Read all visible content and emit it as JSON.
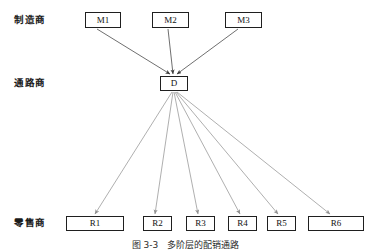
{
  "figure": {
    "width": 371,
    "height": 251,
    "background": "#ffffff",
    "caption": "图 3-3　多阶层的配销通路"
  },
  "tiers": [
    {
      "id": "manufacturer",
      "label": "制造商",
      "x": 14,
      "y": 15
    },
    {
      "id": "distributor",
      "label": "通路商",
      "x": 14,
      "y": 78
    },
    {
      "id": "retailer",
      "label": "零售商",
      "x": 14,
      "y": 218
    }
  ],
  "nodes": {
    "manufacturers": [
      {
        "id": "M1",
        "label": "M1",
        "x": 85,
        "y": 12,
        "w": 36,
        "h": 16
      },
      {
        "id": "M2",
        "label": "M2",
        "x": 152,
        "y": 12,
        "w": 37,
        "h": 16
      },
      {
        "id": "M3",
        "label": "M3",
        "x": 225,
        "y": 12,
        "w": 37,
        "h": 16
      }
    ],
    "distributor": {
      "id": "D",
      "label": "D",
      "x": 160,
      "y": 76,
      "w": 28,
      "h": 15
    },
    "retailers": [
      {
        "id": "R1",
        "label": "R1",
        "x": 66,
        "y": 216,
        "w": 58,
        "h": 15
      },
      {
        "id": "R2",
        "label": "R2",
        "x": 143,
        "y": 216,
        "w": 29,
        "h": 15
      },
      {
        "id": "R3",
        "label": "R3",
        "x": 186,
        "y": 216,
        "w": 29,
        "h": 15
      },
      {
        "id": "R4",
        "label": "R4",
        "x": 228,
        "y": 216,
        "w": 29,
        "h": 15
      },
      {
        "id": "R5",
        "label": "R5",
        "x": 267,
        "y": 216,
        "w": 29,
        "h": 15
      },
      {
        "id": "R6",
        "label": "R6",
        "x": 308,
        "y": 216,
        "w": 56,
        "h": 15
      }
    ]
  },
  "edges": {
    "inbound_color": "#4a4a4a",
    "outbound_color": "#9a9a9a",
    "inbound": [
      {
        "from": "M1",
        "to": "D",
        "x1": 97,
        "y1": 29,
        "x2": 170,
        "y2": 74
      },
      {
        "from": "M2",
        "to": "D",
        "x1": 168,
        "y1": 29,
        "x2": 173,
        "y2": 74
      },
      {
        "from": "M3",
        "to": "D",
        "x1": 238,
        "y1": 29,
        "x2": 177,
        "y2": 74
      }
    ],
    "outbound": [
      {
        "from": "D",
        "to": "R1",
        "x1": 172,
        "y1": 92,
        "x2": 95,
        "y2": 214
      },
      {
        "from": "D",
        "to": "R2",
        "x1": 173,
        "y1": 92,
        "x2": 155,
        "y2": 214
      },
      {
        "from": "D",
        "to": "R3",
        "x1": 174,
        "y1": 92,
        "x2": 198,
        "y2": 214
      },
      {
        "from": "D",
        "to": "R4",
        "x1": 175,
        "y1": 92,
        "x2": 240,
        "y2": 214
      },
      {
        "from": "D",
        "to": "R5",
        "x1": 176,
        "y1": 92,
        "x2": 278,
        "y2": 214
      },
      {
        "from": "D",
        "to": "R6",
        "x1": 177,
        "y1": 92,
        "x2": 330,
        "y2": 214
      }
    ]
  }
}
